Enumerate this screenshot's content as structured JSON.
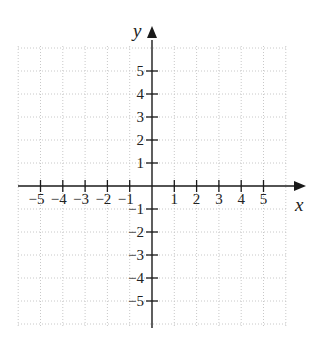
{
  "diagram": {
    "type": "cartesian-coordinate-plane",
    "x_axis": {
      "label": "x",
      "tick_labels": [
        "−5",
        "−4",
        "−3",
        "−2",
        "−1",
        "1",
        "2",
        "3",
        "4",
        "5"
      ],
      "tick_values": [
        -5,
        -4,
        -3,
        -2,
        -1,
        1,
        2,
        3,
        4,
        5
      ],
      "range": [
        -6,
        6
      ]
    },
    "y_axis": {
      "label": "y",
      "tick_labels": [
        "5",
        "4",
        "3",
        "2",
        "1",
        "−1",
        "−2",
        "−3",
        "−4",
        "−5"
      ],
      "tick_values": [
        5,
        4,
        3,
        2,
        1,
        -1,
        -2,
        -3,
        -4,
        -5
      ],
      "range": [
        -6,
        6
      ]
    },
    "grid": {
      "style": "dotted",
      "color": "#c8c8c8",
      "spacing": 1
    },
    "colors": {
      "axis": "#1a1a1a",
      "grid": "#c8c8c8",
      "text": "#222222",
      "background": "#ffffff"
    }
  }
}
